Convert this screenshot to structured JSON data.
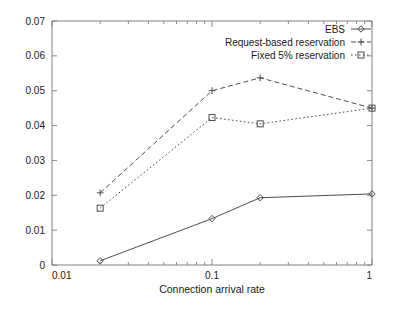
{
  "chart_data": {
    "type": "line",
    "title": "",
    "xlabel": "Connection arrival rate",
    "ylabel": "",
    "xscale": "log",
    "yscale": "linear",
    "xlim": [
      0.01,
      1
    ],
    "ylim": [
      0,
      0.07
    ],
    "grid": false,
    "legend_position": "top-right",
    "x": [
      0.02,
      0.1,
      0.2,
      1.0
    ],
    "xticks": [
      "0.01",
      "0.1",
      "1"
    ],
    "xtick_values": [
      0.01,
      0.1,
      1
    ],
    "yticks": [
      "0",
      "0.01",
      "0.02",
      "0.03",
      "0.04",
      "0.05",
      "0.06",
      "0.07"
    ],
    "ytick_values": [
      0,
      0.01,
      0.02,
      0.03,
      0.04,
      0.05,
      0.06,
      0.07
    ],
    "series": [
      {
        "name": "EBS",
        "marker": "diamond",
        "linestyle": "solid",
        "color": "#4d4d4d",
        "values": [
          0.0012,
          0.0133,
          0.0193,
          0.0204
        ]
      },
      {
        "name": "Request-based reservation",
        "marker": "plus",
        "linestyle": "dashed",
        "color": "#4d4d4d",
        "values": [
          0.0207,
          0.05,
          0.0537,
          0.045
        ]
      },
      {
        "name": "Fixed 5% reservation",
        "marker": "square",
        "linestyle": "dotted",
        "color": "#4d4d4d",
        "values": [
          0.0163,
          0.0423,
          0.0405,
          0.045
        ]
      }
    ]
  }
}
